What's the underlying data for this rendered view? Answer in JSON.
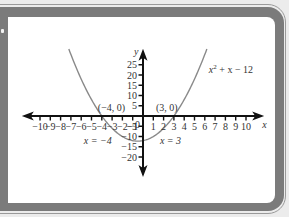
{
  "chart_data": {
    "type": "line",
    "title": "",
    "function_label": "x² + x − 12",
    "function_label_parts": {
      "base": "x",
      "exp": "2",
      "rest": " + x − 12"
    },
    "xlabel": "x",
    "ylabel": "y",
    "xlim": [
      -10,
      10
    ],
    "ylim": [
      -20,
      25
    ],
    "x_ticks": [
      -10,
      -9,
      -8,
      -7,
      -6,
      -5,
      -4,
      -3,
      -2,
      -1,
      0,
      1,
      2,
      3,
      4,
      5,
      6,
      7,
      8,
      9,
      10
    ],
    "x_tick_labels": [
      "−10",
      "−9",
      "−8",
      "−7",
      "−6",
      "−5",
      "−4",
      "−3",
      "−2",
      "−1",
      "0",
      "1",
      "2",
      "3",
      "4",
      "5",
      "6",
      "7",
      "8",
      "9",
      "10"
    ],
    "y_ticks": [
      25,
      20,
      15,
      10,
      5,
      -5,
      -10,
      -15,
      -20
    ],
    "y_tick_labels": [
      "25",
      "20",
      "15",
      "10",
      "5",
      "−5",
      "−10",
      "−15",
      "−20"
    ],
    "series": [
      {
        "name": "x² + x − 12",
        "color": "#8a8a8a",
        "x": [
          -7.2,
          -6,
          -5,
          -4,
          -3,
          -2,
          -1,
          -0.5,
          0,
          1,
          2,
          3,
          4,
          5,
          6.2
        ],
        "y": [
          32.6,
          18,
          8,
          0,
          -6,
          -10,
          -12,
          -12.25,
          -12,
          -10,
          -6,
          0,
          8,
          18,
          32.6
        ]
      }
    ],
    "annotations": [
      {
        "text": "(−4, 0)",
        "x": -4,
        "y": 0
      },
      {
        "text": "(3, 0)",
        "x": 3,
        "y": 0
      },
      {
        "text": "x = −4",
        "x": -4,
        "y": -5.5
      },
      {
        "text": "x = 3",
        "x": 3,
        "y": -5.5
      }
    ],
    "roots": [
      -4,
      3
    ],
    "grid": false,
    "legend": "none"
  },
  "colors": {
    "frame": "#7b7b7b",
    "background": "#ececec",
    "panel": "#ffffff",
    "axis": "#111111",
    "curve": "#8a8a8a",
    "text": "#333333"
  }
}
